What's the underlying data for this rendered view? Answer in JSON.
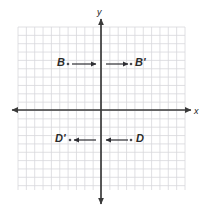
{
  "figure": {
    "background_color": "#ffffff",
    "width": 206,
    "height": 215
  },
  "grid": {
    "left": 18,
    "top": 27,
    "right": 185,
    "bottom": 190,
    "cell_size": 8.35,
    "columns": 20,
    "rows": 20,
    "line_color": "#d8d8dc",
    "show": true
  },
  "axes": {
    "color": "#3a3a3a",
    "origin_x": 101,
    "origin_y": 110,
    "x_axis": {
      "label": "x",
      "label_x": 194,
      "label_y": 107,
      "start_x": 12,
      "end_x": 191,
      "y": 110
    },
    "y_axis": {
      "label": "y",
      "label_x": 97,
      "label_y": 8,
      "start_y": 19,
      "end_y": 204,
      "x": 101
    }
  },
  "points": [
    {
      "name": "B",
      "label": "B",
      "label_x": 57,
      "label_y": 57,
      "marker_x": 68,
      "marker_y": 64
    },
    {
      "name": "B-prime",
      "label": "B'",
      "label_x": 135,
      "label_y": 57,
      "marker_x": 131,
      "marker_y": 64
    },
    {
      "name": "D-prime",
      "label": "D'",
      "label_x": 55,
      "label_y": 133,
      "marker_x": 70,
      "marker_y": 140
    },
    {
      "name": "D",
      "label": "D",
      "label_x": 136,
      "label_y": 133,
      "marker_x": 131,
      "marker_y": 140
    }
  ],
  "vectors": [
    {
      "name": "b-vector-left",
      "direction": "right",
      "x1": 72,
      "y1": 64,
      "x2": 96,
      "y2": 64
    },
    {
      "name": "b-vector-right",
      "direction": "right",
      "x1": 106,
      "y1": 64,
      "x2": 128,
      "y2": 64
    },
    {
      "name": "d-vector-left",
      "direction": "left",
      "x1": 96,
      "y1": 140,
      "x2": 74,
      "y2": 140
    },
    {
      "name": "d-vector-right",
      "direction": "left",
      "x1": 128,
      "y1": 140,
      "x2": 106,
      "y2": 140
    }
  ],
  "colors": {
    "grid": "#d8d8dc",
    "axis": "#3a3a3a",
    "vector": "#2e2e33",
    "label": "#2b2b2b",
    "marker": "#4a4a52"
  }
}
